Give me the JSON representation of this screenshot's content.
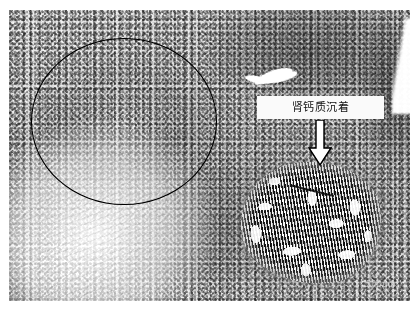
{
  "figure": {
    "type": "histopathology-photomicrograph",
    "stain_appearance": "grayscale / black-and-white halftone"
  },
  "annotations": {
    "label": {
      "text": "肾钙质沉着",
      "meaning": "nephrocalcinosis / renal calcium deposition",
      "box_background": "#f4f3f1",
      "text_color": "#171717"
    },
    "arrow": {
      "name": "down-arrow",
      "direction": "down",
      "fill": "#ffffff",
      "outline": "#000000",
      "points_to": "calcified deposit"
    },
    "circle": {
      "name": "region-of-interest-circle",
      "stroke": "#000000",
      "fill": "none",
      "marks": "pale nodular cortical area"
    },
    "scalebar": {
      "text": "500µm"
    }
  },
  "regions": [
    {
      "name": "roi-pale-nodule",
      "position": "upper-left",
      "tone": "pale gray"
    },
    {
      "name": "calcified-deposit",
      "position": "lower-right",
      "tone": "dense black striated"
    },
    {
      "name": "dark-cortex",
      "position": "upper-right",
      "tone": "dark gray"
    },
    {
      "name": "fibrous-capsule",
      "position": "left and lower-left",
      "tone": "near white"
    }
  ]
}
